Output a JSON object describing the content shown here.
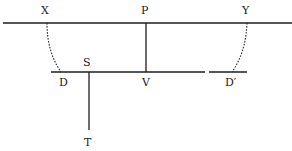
{
  "diagram": {
    "labels": {
      "X": "X",
      "P": "P",
      "Y": "Y",
      "S": "S",
      "D": "D",
      "V": "V",
      "D_prime": "D′",
      "T": "T"
    },
    "colors": {
      "ink": "#1e1e1e",
      "background": "#ffffff"
    }
  }
}
